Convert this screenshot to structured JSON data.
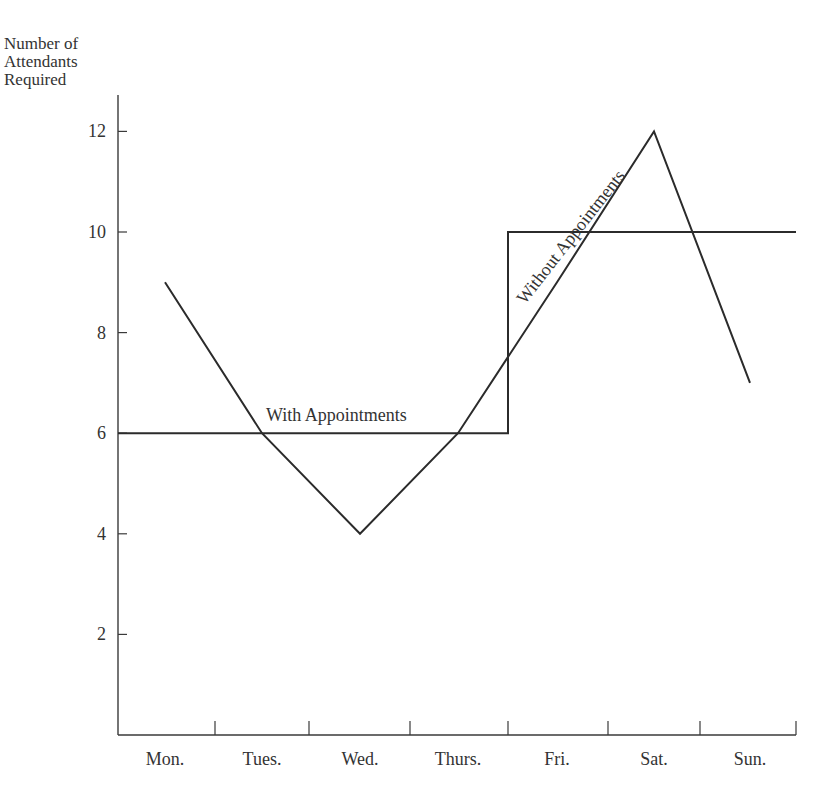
{
  "chart_data": {
    "type": "line",
    "title": "",
    "xlabel": "",
    "ylabel": "Number of Attendants Required",
    "ylabel_lines": [
      "Number of",
      "Attendants",
      "Required"
    ],
    "categories": [
      "Mon.",
      "Tues.",
      "Wed.",
      "Thurs.",
      "Fri.",
      "Sat.",
      "Sun."
    ],
    "yticks": [
      2,
      4,
      6,
      8,
      10,
      12
    ],
    "ylim": [
      0,
      13
    ],
    "grid": false,
    "legend": "none (inline annotations)",
    "series": [
      {
        "name": "Without Appointments",
        "style": "line",
        "values": [
          9,
          6,
          4,
          6,
          9,
          12,
          7
        ]
      },
      {
        "name": "With Appointments",
        "style": "step",
        "values": [
          6,
          6,
          6,
          6,
          10,
          10,
          10
        ]
      }
    ],
    "annotations": [
      {
        "text": "With Appointments",
        "near": "Tues.-Thurs., above y=6"
      },
      {
        "text": "Without Appointments",
        "near": "Fri.-Sat., rotated along rising line"
      }
    ]
  },
  "labels": {
    "ylabel": [
      "Number of",
      "Attendants",
      "Required"
    ],
    "with": "With Appointments",
    "without": "Without Appointments"
  },
  "colors": {
    "line": "#2b2b2b",
    "axis": "#3a3a3a",
    "background": "#ffffff"
  }
}
